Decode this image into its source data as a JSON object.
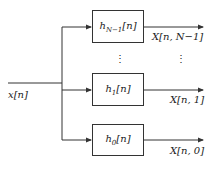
{
  "input": {
    "label": "x[n]"
  },
  "filters": [
    {
      "name": "h",
      "sub": "N−1",
      "arg": "[n]",
      "output": "X[n, N−1]"
    },
    {
      "name": "h",
      "sub": "1",
      "arg": "[n]",
      "output": "X[n, 1]"
    },
    {
      "name": "h",
      "sub": "0",
      "arg": "[n]",
      "output": "X[n, 0]"
    }
  ],
  "ellipsis": "⋮",
  "colors": {
    "line": "#333333",
    "text": "#222222"
  }
}
